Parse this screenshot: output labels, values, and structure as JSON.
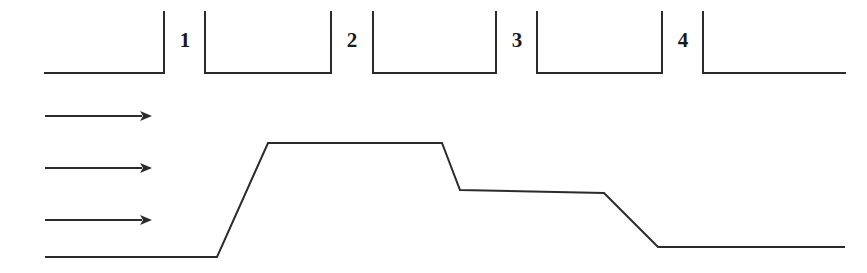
{
  "figure": {
    "canvas": {
      "width": 867,
      "height": 273
    },
    "background_color": "#ffffff",
    "stroke_color": "#2b2b2b"
  },
  "top_diagram": {
    "name": "bracket-profile",
    "baseline_y": 73,
    "bracket_top_y": 12,
    "left_segment": {
      "x_start": 45,
      "x_end": 164
    },
    "right_segment": {
      "x_start": 703,
      "x_end": 845
    },
    "brackets": [
      {
        "label": "1",
        "label_x": 185,
        "label_y": 30,
        "left_x": 205,
        "right_x": 331
      },
      {
        "label": "2",
        "label_x": 352,
        "label_y": 30,
        "left_x": 373,
        "right_x": 496
      },
      {
        "label": "3",
        "label_x": 517,
        "label_y": 30,
        "left_x": 537,
        "right_x": 662
      }
    ],
    "bar_x_positions": [
      164,
      205,
      331,
      373,
      496,
      537,
      662,
      703
    ],
    "labels": [
      {
        "text": "1",
        "x": 185,
        "y": 30
      },
      {
        "text": "2",
        "x": 352,
        "y": 30
      },
      {
        "text": "3",
        "x": 517,
        "y": 30
      },
      {
        "text": "4",
        "x": 683,
        "y": 30
      }
    ]
  },
  "bottom_diagram": {
    "name": "flow-step-profile",
    "arrows": [
      {
        "x_start": 45,
        "x_end": 152,
        "y": 116
      },
      {
        "x_start": 45,
        "x_end": 152,
        "y": 168
      },
      {
        "x_start": 45,
        "x_end": 152,
        "y": 220
      }
    ],
    "arrow_head_length": 12,
    "arrow_head_half_width": 5,
    "profile_points": [
      {
        "x": 45,
        "y": 257
      },
      {
        "x": 217,
        "y": 257
      },
      {
        "x": 268,
        "y": 143
      },
      {
        "x": 442,
        "y": 143
      },
      {
        "x": 460,
        "y": 190
      },
      {
        "x": 604,
        "y": 193
      },
      {
        "x": 658,
        "y": 247
      },
      {
        "x": 845,
        "y": 247
      }
    ]
  },
  "chart_data": {
    "type": "line",
    "title": "",
    "xlabel": "",
    "ylabel": "",
    "series": [
      {
        "name": "top-bracket-profile",
        "points": [
          [
            45,
            73
          ],
          [
            164,
            73
          ],
          [
            164,
            12
          ],
          [
            205,
            12
          ],
          [
            205,
            73
          ],
          [
            331,
            73
          ],
          [
            331,
            12
          ],
          [
            373,
            12
          ],
          [
            373,
            73
          ],
          [
            496,
            73
          ],
          [
            496,
            12
          ],
          [
            537,
            12
          ],
          [
            537,
            73
          ],
          [
            662,
            73
          ],
          [
            662,
            12
          ],
          [
            703,
            12
          ],
          [
            703,
            73
          ],
          [
            845,
            73
          ]
        ]
      },
      {
        "name": "bottom-step-profile",
        "points": [
          [
            45,
            257
          ],
          [
            217,
            257
          ],
          [
            268,
            143
          ],
          [
            442,
            143
          ],
          [
            460,
            190
          ],
          [
            604,
            193
          ],
          [
            658,
            247
          ],
          [
            845,
            247
          ]
        ]
      }
    ],
    "annotations": [
      "1",
      "2",
      "3",
      "4"
    ],
    "grid": false,
    "legend": "none"
  }
}
